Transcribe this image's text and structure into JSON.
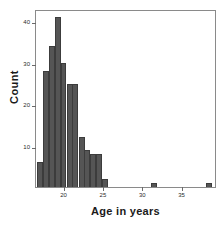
{
  "chart_data": {
    "type": "bar",
    "title": "",
    "subtitle": "",
    "xlabel": "Age in years",
    "ylabel": "Count",
    "xlim": [
      16.5,
      39.5
    ],
    "ylim": [
      0,
      43
    ],
    "grid": false,
    "legend": null,
    "bin_width": 0.75,
    "xticks": [
      20,
      25,
      30,
      35
    ],
    "xtick_labels": [
      "20",
      "25",
      "30",
      "35"
    ],
    "yticks": [
      10,
      20,
      30,
      40
    ],
    "ytick_labels": [
      "10",
      "20",
      "30",
      "40"
    ],
    "bar_color": "#555555",
    "bar_edge_color": "#3c3c3c",
    "frame_color": "#8a8a8a",
    "categories": [
      "17.0",
      "17.8",
      "18.5",
      "19.3",
      "20.0",
      "20.8",
      "21.5",
      "22.3",
      "23.0",
      "23.8",
      "24.5",
      "25.3",
      "31.5",
      "38.5"
    ],
    "bin_centers": [
      17.0,
      17.8,
      18.5,
      19.3,
      20.0,
      20.8,
      21.5,
      22.3,
      23.0,
      23.8,
      24.5,
      25.3,
      31.5,
      38.5
    ],
    "values": [
      6,
      28,
      34,
      41,
      30,
      25,
      25,
      12,
      9,
      8,
      8,
      2,
      1,
      1
    ]
  },
  "axes": {
    "x_title": "Age in years",
    "y_title": "Count"
  },
  "caption": {
    "strip_text": ""
  }
}
